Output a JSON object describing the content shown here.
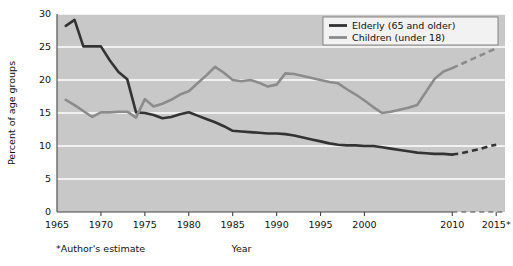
{
  "chart_data": {
    "type": "line",
    "title": "",
    "xlabel": "Year",
    "ylabel": "Percent of age groups",
    "xlim": [
      1965,
      2016
    ],
    "ylim": [
      0,
      30
    ],
    "yticks": [
      0,
      5,
      10,
      15,
      20,
      25,
      30
    ],
    "xticks": [
      1965,
      1970,
      1975,
      1980,
      1985,
      1990,
      1995,
      2000,
      2010,
      2015
    ],
    "xtick_labels": [
      "1965",
      "1970",
      "1975",
      "1980",
      "1985",
      "1990",
      "1995",
      "2000",
      "2010",
      "2015*"
    ],
    "ytick_labels": [
      "0",
      "5",
      "10",
      "15",
      "20",
      "25",
      "30"
    ],
    "grid": "horizontal",
    "legend_position": "top-right",
    "plot_background": "#c8c8c8",
    "series": [
      {
        "name": "Elderly (65 and older)",
        "color": "#333333",
        "linewidth": 2.6,
        "x": [
          1966,
          1967,
          1968,
          1969,
          1970,
          1971,
          1972,
          1973,
          1974,
          1975,
          1976,
          1977,
          1978,
          1979,
          1980,
          1981,
          1982,
          1983,
          1984,
          1985,
          1986,
          1987,
          1988,
          1989,
          1990,
          1991,
          1992,
          1993,
          1994,
          1995,
          1996,
          1997,
          1998,
          1999,
          2000,
          2001,
          2002,
          2003,
          2004,
          2005,
          2006,
          2007,
          2008,
          2009,
          2010
        ],
        "values": [
          28.2,
          29.1,
          25.1,
          25.1,
          25.1,
          23.0,
          21.2,
          20.1,
          15.1,
          15.0,
          14.7,
          14.2,
          14.4,
          14.8,
          15.1,
          14.6,
          14.1,
          13.6,
          13.0,
          12.3,
          12.2,
          12.1,
          12.0,
          11.9,
          11.9,
          11.8,
          11.6,
          11.3,
          11.0,
          10.7,
          10.4,
          10.2,
          10.1,
          10.1,
          10.0,
          10.0,
          9.8,
          9.6,
          9.4,
          9.2,
          9.0,
          8.9,
          8.8,
          8.8,
          8.7
        ],
        "projection_x": [
          2010,
          2011,
          2012,
          2013,
          2014,
          2015
        ],
        "projection_values": [
          8.7,
          8.9,
          9.2,
          9.5,
          9.9,
          10.2
        ],
        "projection_style": "dashed"
      },
      {
        "name": "Children (under 18)",
        "color": "#8c8c8c",
        "linewidth": 2.6,
        "x": [
          1966,
          1967,
          1968,
          1969,
          1970,
          1971,
          1972,
          1973,
          1974,
          1975,
          1976,
          1977,
          1978,
          1979,
          1980,
          1981,
          1982,
          1983,
          1984,
          1985,
          1986,
          1987,
          1988,
          1989,
          1990,
          1991,
          1992,
          1993,
          1994,
          1995,
          1996,
          1997,
          1998,
          1999,
          2000,
          2001,
          2002,
          2003,
          2004,
          2005,
          2006,
          2007,
          2008,
          2009,
          2010
        ],
        "values": [
          17.0,
          16.2,
          15.3,
          14.4,
          15.1,
          15.1,
          15.2,
          15.2,
          14.3,
          17.1,
          16.0,
          16.4,
          17.0,
          17.8,
          18.3,
          19.5,
          20.7,
          22.0,
          21.1,
          20.0,
          19.8,
          20.0,
          19.6,
          19.0,
          19.3,
          21.0,
          20.9,
          20.6,
          20.3,
          20.0,
          19.7,
          19.5,
          18.6,
          17.8,
          16.9,
          15.9,
          15.0,
          15.2,
          15.5,
          15.8,
          16.2,
          18.2,
          20.2,
          21.3,
          21.8
        ],
        "projection_x": [
          2010,
          2011,
          2012,
          2013,
          2014,
          2015
        ],
        "projection_values": [
          21.8,
          22.4,
          23.0,
          23.6,
          24.2,
          24.8
        ],
        "projection_style": "dashed"
      }
    ],
    "annotations": [
      {
        "text": "*Author's estimate",
        "position": "below-left"
      }
    ]
  },
  "legend": {
    "items": [
      {
        "label": "Elderly (65 and older)",
        "color": "#333333"
      },
      {
        "label": "Children (under 18)",
        "color": "#8c8c8c"
      }
    ]
  },
  "labels": {
    "y_axis_title": "Percent of age groups",
    "x_axis_title": "Year",
    "footnote": "*Author's estimate"
  }
}
